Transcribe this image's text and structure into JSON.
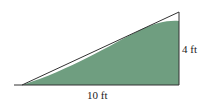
{
  "diagram": {
    "type": "right-triangle-ramp",
    "labels": {
      "height": "4 ft",
      "base": "10 ft"
    },
    "colors": {
      "fill": "#6f9e80",
      "stroke": "#333333",
      "background": "#ffffff"
    }
  }
}
